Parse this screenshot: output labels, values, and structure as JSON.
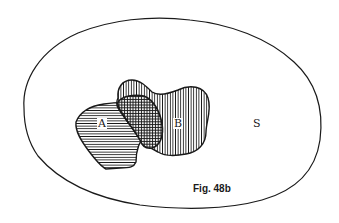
{
  "diagram": {
    "type": "venn",
    "universe": {
      "label": "S"
    },
    "sets": [
      {
        "label": "A",
        "hatch": "horizontal"
      },
      {
        "label": "B",
        "hatch": "vertical"
      }
    ],
    "intersection": {
      "sets": [
        "A",
        "B"
      ],
      "hatch": "crosshatch"
    },
    "caption": "Fig. 48b"
  },
  "colors": {
    "ink": "#1a1a1a",
    "background": "#ffffff"
  }
}
